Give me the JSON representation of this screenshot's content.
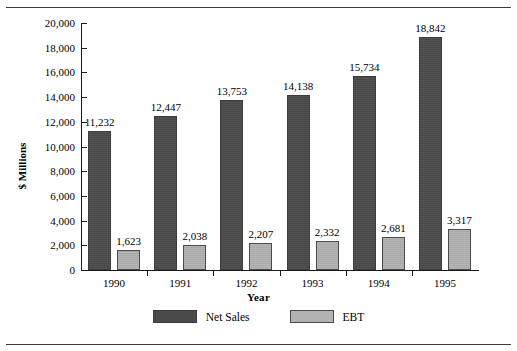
{
  "chart_data": {
    "type": "bar",
    "title": "",
    "xlabel": "Year",
    "ylabel": "$ Millions",
    "categories": [
      "1990",
      "1991",
      "1992",
      "1993",
      "1994",
      "1995"
    ],
    "series": [
      {
        "name": "Net Sales",
        "color": "#4b4b4b",
        "values": [
          11232,
          12447,
          13753,
          14138,
          15734,
          18842
        ],
        "labels": [
          "11,232",
          "12,447",
          "13,753",
          "14,138",
          "15,734",
          "18,842"
        ]
      },
      {
        "name": "EBT",
        "color": "#b2b2b2",
        "values": [
          1623,
          2038,
          2207,
          2332,
          2681,
          3317
        ],
        "labels": [
          "1,623",
          "2,038",
          "2,207",
          "2,332",
          "2,681",
          "3,317"
        ]
      }
    ],
    "ylim": [
      0,
      20000
    ],
    "ytick_step": 2000,
    "ytick_labels": [
      "20,000",
      "18,000",
      "16,000",
      "14,000",
      "12,000",
      "10,000",
      "8,000",
      "6,000",
      "4,000",
      "2,000",
      "0"
    ],
    "grid": false,
    "legend_position": "bottom"
  },
  "legend": {
    "items": [
      {
        "label": "Net Sales"
      },
      {
        "label": "EBT"
      }
    ]
  }
}
